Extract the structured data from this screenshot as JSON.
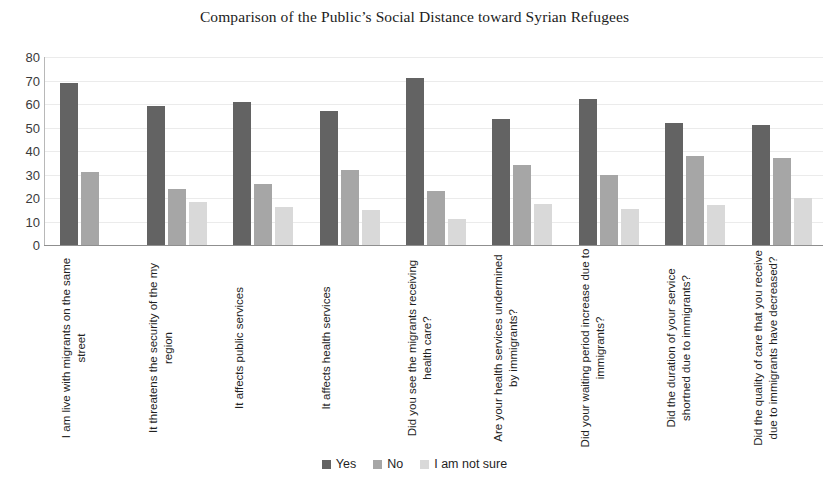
{
  "chart_data": {
    "type": "bar",
    "title": "Comparison of the Public’s Social Distance toward Syrian Refugees",
    "xlabel": "",
    "ylabel": "",
    "ylim": [
      0,
      80
    ],
    "yticks": [
      80,
      70,
      60,
      50,
      40,
      30,
      20,
      10,
      0
    ],
    "grid": true,
    "legend_position": "bottom",
    "categories": [
      "I am live with migrants on the same street",
      "It threatens the security of the my region",
      "It affects public services",
      "It affects health services",
      "Did you see the migrants receiving health care?",
      "Are your health services undermined by immigrants?",
      "Did your waiting period increase due to immigrants?",
      "Did the duration of your service shortned due to immigrants?",
      "Did the quality of care that you receive due to immigrants have decreased?"
    ],
    "series": [
      {
        "name": "Yes",
        "color": "#636363",
        "values": [
          69,
          59,
          61,
          57,
          71,
          53.5,
          62,
          52,
          51
        ]
      },
      {
        "name": "No",
        "color": "#a6a6a6",
        "values": [
          31,
          24,
          26,
          32,
          23,
          34,
          30,
          38,
          37
        ]
      },
      {
        "name": "I am not sure",
        "color": "#d9d9d9",
        "values": [
          0,
          18.5,
          16,
          15,
          11,
          17.5,
          15.5,
          17,
          20
        ]
      }
    ]
  },
  "legend": {
    "items": [
      {
        "label": "Yes",
        "color": "#636363"
      },
      {
        "label": "No",
        "color": "#a6a6a6"
      },
      {
        "label": "I am not sure",
        "color": "#d9d9d9"
      }
    ]
  }
}
